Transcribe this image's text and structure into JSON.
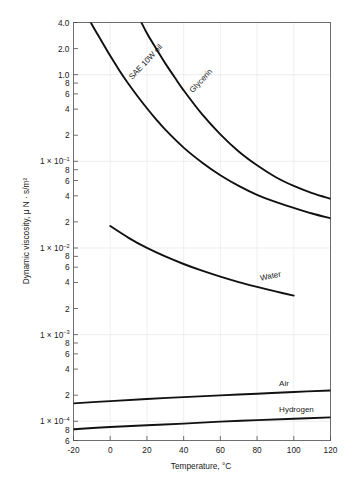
{
  "chart_data": {
    "type": "line",
    "title": "",
    "xlabel": "Temperature, °C",
    "ylabel": "Dynamic viscosity, μ N · s/m²",
    "xlim": [
      -20,
      120
    ],
    "ylim": [
      6e-06,
      0.4
    ],
    "yscale": "log",
    "xscale": "linear",
    "grid": true,
    "legend": "inline-curve-labels",
    "xticks": [
      "-20",
      "0",
      "20",
      "40",
      "60",
      "80",
      "100",
      "120"
    ],
    "xtick_values": [
      -20,
      0,
      20,
      40,
      60,
      80,
      100,
      120
    ],
    "yticks": [
      {
        "label": "4.0",
        "mantissa": "4.0",
        "exponent": "",
        "value": 0.4
      },
      {
        "label": "2.0",
        "mantissa": "2.0",
        "exponent": "",
        "value": 0.2
      },
      {
        "label": "1.0",
        "mantissa": "1.0",
        "exponent": "",
        "value": 0.1
      },
      {
        "label": "8",
        "mantissa": "8",
        "exponent": "",
        "value": 0.08
      },
      {
        "label": "6",
        "mantissa": "6",
        "exponent": "",
        "value": 0.06
      },
      {
        "label": "4",
        "mantissa": "4",
        "exponent": "",
        "value": 0.04
      },
      {
        "label": "2",
        "mantissa": "2",
        "exponent": "",
        "value": 0.02
      },
      {
        "label": "1 × 10-1",
        "mantissa": "1 × 10",
        "exponent": "–1",
        "value": 0.01
      },
      {
        "label": "8",
        "mantissa": "8",
        "exponent": "",
        "value": 0.008
      },
      {
        "label": "6",
        "mantissa": "6",
        "exponent": "",
        "value": 0.006
      },
      {
        "label": "4",
        "mantissa": "4",
        "exponent": "",
        "value": 0.004
      },
      {
        "label": "2",
        "mantissa": "2",
        "exponent": "",
        "value": 0.002
      },
      {
        "label": "1 × 10-2",
        "mantissa": "1 × 10",
        "exponent": "–2",
        "value": 0.001
      },
      {
        "label": "8",
        "mantissa": "8",
        "exponent": "",
        "value": 0.0008
      },
      {
        "label": "6",
        "mantissa": "6",
        "exponent": "",
        "value": 0.0006
      },
      {
        "label": "4",
        "mantissa": "4",
        "exponent": "",
        "value": 0.0004
      },
      {
        "label": "2",
        "mantissa": "2",
        "exponent": "",
        "value": 0.0002
      },
      {
        "label": "1 × 10-3",
        "mantissa": "1 × 10",
        "exponent": "–3",
        "value": 0.0001
      },
      {
        "label": "8",
        "mantissa": "8",
        "exponent": "",
        "value": 8e-05
      },
      {
        "label": "6",
        "mantissa": "6",
        "exponent": "",
        "value": 6e-05
      },
      {
        "label": "4",
        "mantissa": "4",
        "exponent": "",
        "value": 4e-05
      },
      {
        "label": "2",
        "mantissa": "2",
        "exponent": "",
        "value": 2e-05
      },
      {
        "label": "1 × 10-4",
        "mantissa": "1 × 10",
        "exponent": "–4",
        "value": 1e-05
      },
      {
        "label": "8",
        "mantissa": "8",
        "exponent": "",
        "value": 8e-06
      },
      {
        "label": "6",
        "mantissa": "6",
        "exponent": "",
        "value": 6e-06
      }
    ],
    "series": [
      {
        "name": "SAE 10W oil",
        "label": "SAE 10W oil",
        "label_rotation": -47,
        "points": [
          [
            -20,
            0.95
          ],
          [
            -15,
            0.6
          ],
          [
            -10,
            0.38
          ],
          [
            -5,
            0.25
          ],
          [
            0,
            0.165
          ],
          [
            5,
            0.112
          ],
          [
            10,
            0.078
          ],
          [
            15,
            0.056
          ],
          [
            20,
            0.041
          ],
          [
            25,
            0.0305
          ],
          [
            30,
            0.0232
          ],
          [
            40,
            0.0144
          ],
          [
            50,
            0.0097
          ],
          [
            60,
            0.0069
          ],
          [
            70,
            0.0052
          ],
          [
            80,
            0.0041
          ],
          [
            90,
            0.0034
          ],
          [
            100,
            0.0029
          ],
          [
            110,
            0.0025
          ],
          [
            120,
            0.0022
          ]
        ]
      },
      {
        "name": "Glycerin",
        "label": "Glycerin",
        "label_rotation": -47,
        "points": [
          [
            8,
            0.9
          ],
          [
            12,
            0.62
          ],
          [
            16,
            0.44
          ],
          [
            20,
            0.3
          ],
          [
            25,
            0.2
          ],
          [
            30,
            0.135
          ],
          [
            35,
            0.094
          ],
          [
            40,
            0.066
          ],
          [
            50,
            0.035
          ],
          [
            60,
            0.0205
          ],
          [
            70,
            0.013
          ],
          [
            80,
            0.009
          ],
          [
            90,
            0.0066
          ],
          [
            100,
            0.0052
          ],
          [
            110,
            0.0043
          ],
          [
            120,
            0.0037
          ]
        ]
      },
      {
        "name": "Water",
        "label": "Water",
        "label_rotation": -12,
        "points": [
          [
            0,
            0.00179
          ],
          [
            10,
            0.00131
          ],
          [
            20,
            0.001
          ],
          [
            30,
            0.000798
          ],
          [
            40,
            0.000653
          ],
          [
            50,
            0.000547
          ],
          [
            60,
            0.000467
          ],
          [
            70,
            0.000404
          ],
          [
            80,
            0.000355
          ],
          [
            90,
            0.000315
          ],
          [
            100,
            0.000282
          ]
        ]
      },
      {
        "name": "Air",
        "label": "Air",
        "label_rotation": 0,
        "points": [
          [
            -20,
            1.61e-05
          ],
          [
            0,
            1.71e-05
          ],
          [
            20,
            1.81e-05
          ],
          [
            40,
            1.9e-05
          ],
          [
            60,
            1.99e-05
          ],
          [
            80,
            2.08e-05
          ],
          [
            100,
            2.18e-05
          ],
          [
            120,
            2.27e-05
          ]
        ]
      },
      {
        "name": "Hydrogen",
        "label": "Hydrogen",
        "label_rotation": 0,
        "points": [
          [
            -20,
            8.1e-06
          ],
          [
            0,
            8.6e-06
          ],
          [
            20,
            9e-06
          ],
          [
            40,
            9.4e-06
          ],
          [
            60,
            9.9e-06
          ],
          [
            80,
            1.03e-05
          ],
          [
            100,
            1.07e-05
          ],
          [
            120,
            1.11e-05
          ]
        ]
      }
    ],
    "colors": {
      "curve": "#111111",
      "frame": "#6e6e6e",
      "grid": "#e6e6e6",
      "text": "#1a1a1a",
      "background": "#ffffff"
    }
  }
}
